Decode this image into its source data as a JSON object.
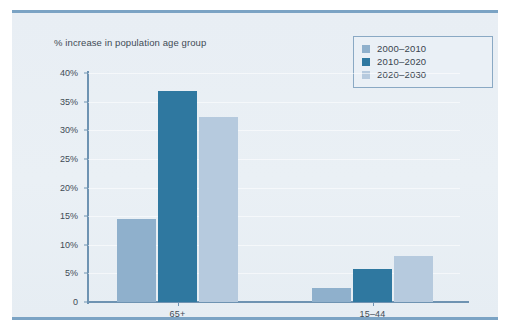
{
  "chart_data": {
    "type": "bar",
    "title": "% increase in population age group",
    "xlabel": "",
    "ylabel": "",
    "categories": [
      "65+",
      "15–44"
    ],
    "series": [
      {
        "name": "2000–2010",
        "color": "#8fb0cc",
        "values": [
          14.5,
          2.5
        ]
      },
      {
        "name": "2010–2020",
        "color": "#2f78a0",
        "values": [
          36.8,
          5.8
        ]
      },
      {
        "name": "2020–2030",
        "color": "#b6cade",
        "values": [
          32.3,
          8.0
        ]
      }
    ],
    "ylim": [
      0,
      40
    ],
    "y_ticks": [
      0,
      5,
      10,
      15,
      20,
      25,
      30,
      35,
      40
    ],
    "y_tick_labels": [
      "0",
      "5%",
      "10%",
      "15%",
      "20%",
      "25%",
      "30%",
      "35%",
      "40%"
    ],
    "grid": true,
    "legend_position": "top-right"
  },
  "colors": {
    "panel_background": "#e9eff5",
    "rule": "#7ba3c4",
    "axis": "#6e93b2",
    "text": "#3f4b55",
    "legend_border": "#8aa9c4"
  }
}
